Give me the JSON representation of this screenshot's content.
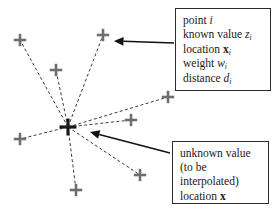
{
  "figure": {
    "background_color": "#ffffff",
    "marker_color": "#6e6e6e",
    "center_marker_color": "#1a1a1a",
    "line_color": "#3a3a3a",
    "box_border_color": "#2b2b2b",
    "text_color": "#1a1a1a"
  },
  "callouts": {
    "known": {
      "name": "known-point-callout",
      "lines": [
        {
          "prefix": "point ",
          "variable": "i",
          "subscript": "",
          "bold": false
        },
        {
          "prefix": "known value ",
          "variable": "z",
          "subscript": "i",
          "bold": false
        },
        {
          "prefix": "location ",
          "variable": "x",
          "subscript": "i",
          "bold": true
        },
        {
          "prefix": "weight ",
          "variable": "w",
          "subscript": "i",
          "bold": false
        },
        {
          "prefix": "distance ",
          "variable": "d",
          "subscript": "i",
          "bold": false
        }
      ]
    },
    "unknown": {
      "name": "unknown-point-callout",
      "lines": [
        {
          "prefix": "unknown value",
          "variable": "",
          "subscript": "",
          "bold": false
        },
        {
          "prefix": "(to be",
          "variable": "",
          "subscript": "",
          "bold": false
        },
        {
          "prefix": "interpolated)",
          "variable": "",
          "subscript": "",
          "bold": false
        },
        {
          "prefix": "location ",
          "variable": "x",
          "subscript": "",
          "bold": true
        }
      ]
    }
  },
  "chart_data": {
    "type": "scatter",
    "xlabel": "",
    "ylabel": "",
    "xlim": [
      0,
      278
    ],
    "ylim": [
      0,
      213
    ],
    "grid": false,
    "legend": "none",
    "center_point": {
      "label": "unknown value (to be interpolated), location x",
      "x": 68,
      "y": 127
    },
    "known_points": [
      {
        "id": 1,
        "x": 20,
        "y": 40
      },
      {
        "id": 2,
        "x": 56,
        "y": 70
      },
      {
        "id": 3,
        "x": 103,
        "y": 35
      },
      {
        "id": 4,
        "x": 168,
        "y": 97
      },
      {
        "id": 5,
        "x": 131,
        "y": 120
      },
      {
        "id": 6,
        "x": 20,
        "y": 139
      },
      {
        "id": 7,
        "x": 140,
        "y": 175
      },
      {
        "id": 8,
        "x": 76,
        "y": 190
      }
    ],
    "distance_lines": [
      {
        "from": [
          68,
          127
        ],
        "to": [
          20,
          40
        ]
      },
      {
        "from": [
          68,
          127
        ],
        "to": [
          56,
          70
        ]
      },
      {
        "from": [
          68,
          127
        ],
        "to": [
          103,
          35
        ]
      },
      {
        "from": [
          68,
          127
        ],
        "to": [
          168,
          97
        ]
      },
      {
        "from": [
          68,
          127
        ],
        "to": [
          131,
          120
        ]
      },
      {
        "from": [
          68,
          127
        ],
        "to": [
          20,
          139
        ]
      },
      {
        "from": [
          68,
          127
        ],
        "to": [
          140,
          175
        ]
      },
      {
        "from": [
          68,
          127
        ],
        "to": [
          76,
          190
        ]
      }
    ],
    "annotation_arrows": [
      {
        "label": "known-point-arrow",
        "from": [
          174,
          43
        ],
        "to": [
          114,
          41
        ]
      },
      {
        "label": "unknown-point-arrow",
        "from": [
          170,
          153
        ],
        "to": [
          90,
          132
        ]
      }
    ]
  }
}
